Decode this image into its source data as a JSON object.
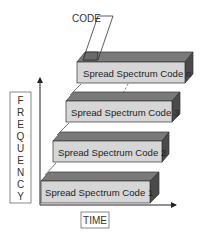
{
  "diagram": {
    "code_label": "CODE",
    "axis_y_label_letters": [
      "F",
      "R",
      "E",
      "Q",
      "U",
      "E",
      "N",
      "C",
      "Y"
    ],
    "axis_y_label": "FREQUENCY",
    "axis_x_label": "TIME",
    "boxes": [
      {
        "label": "Spread Spectrum Code n"
      },
      {
        "label": "Spread Spectrum Code 3"
      },
      {
        "label": "Spread Spectrum Code 2"
      },
      {
        "label": "Spread Spectrum Code 1"
      }
    ],
    "colors": {
      "front_face": "#d6d6d6",
      "top_face": "#7a7a7a",
      "side_face": "#4a4a4a",
      "outline": "#333333",
      "axis": "#222222"
    }
  }
}
